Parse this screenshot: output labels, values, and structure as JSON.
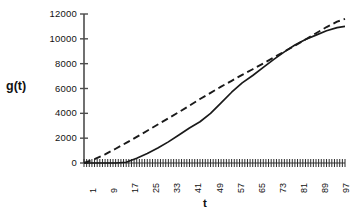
{
  "chart_data": {
    "type": "line",
    "title": "",
    "xlabel": "t",
    "ylabel": "g(t)",
    "xlim": [
      1,
      100
    ],
    "ylim": [
      0,
      12000
    ],
    "grid": false,
    "legend": "none",
    "y_ticks": [
      0,
      2000,
      4000,
      6000,
      8000,
      10000,
      12000
    ],
    "y_tick_labels": [
      "0",
      "2000",
      "4000",
      "6000",
      "8000",
      "10000",
      "12000"
    ],
    "x_ticks": [
      1,
      9,
      17,
      25,
      33,
      41,
      49,
      57,
      65,
      73,
      81,
      89,
      97
    ],
    "x_tick_labels": [
      "1",
      "9",
      "17",
      "25",
      "33",
      "41",
      "49",
      "57",
      "65",
      "73",
      "81",
      "89",
      "97"
    ],
    "x_minor_tick_count": 100,
    "series": [
      {
        "name": "solid",
        "style": "solid",
        "color": "#1a1a1a",
        "x": [
          1,
          5,
          9,
          13,
          17,
          21,
          25,
          29,
          33,
          37,
          41,
          45,
          49,
          53,
          57,
          61,
          65,
          69,
          73,
          77,
          81,
          85,
          89,
          93,
          97,
          100
        ],
        "values": [
          0,
          0,
          0,
          0,
          60,
          380,
          760,
          1200,
          1700,
          2250,
          2820,
          3320,
          4000,
          4850,
          5700,
          6450,
          7050,
          7700,
          8350,
          8950,
          9500,
          9950,
          10300,
          10650,
          10900,
          11000
        ]
      },
      {
        "name": "dashed",
        "style": "dashed",
        "color": "#1a1a1a",
        "x": [
          1,
          5,
          9,
          13,
          17,
          21,
          25,
          29,
          33,
          37,
          41,
          45,
          49,
          53,
          57,
          61,
          65,
          69,
          73,
          77,
          81,
          85,
          89,
          93,
          97,
          100
        ],
        "values": [
          0,
          320,
          700,
          1150,
          1620,
          2100,
          2600,
          3100,
          3600,
          4100,
          4620,
          5150,
          5650,
          6150,
          6620,
          7100,
          7550,
          8020,
          8500,
          8980,
          9450,
          9950,
          10450,
          10950,
          11380,
          11600
        ]
      }
    ]
  },
  "axes": {
    "y_axis_x": 84,
    "plot_left": 84,
    "plot_right": 345,
    "plot_top": 14,
    "plot_bottom": 163
  }
}
